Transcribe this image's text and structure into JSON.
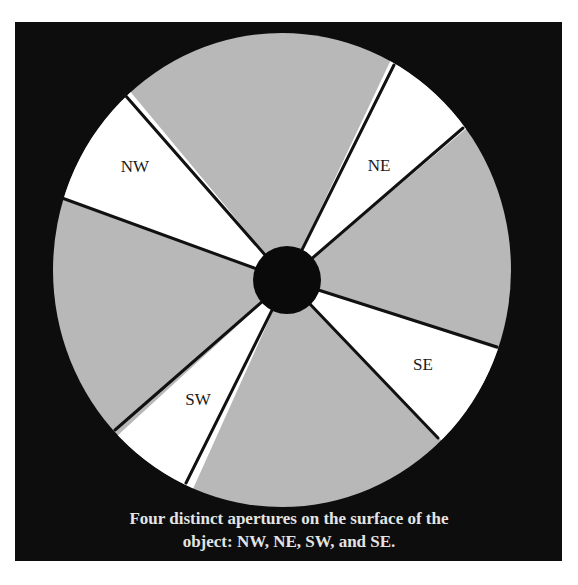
{
  "figure": {
    "caption_line1": "Four distinct apertures on the surface of the",
    "caption_line2": "object: NW, NE, SW, and SE.",
    "colors": {
      "background": "#0d0d0d",
      "disk": "#b8b8b8",
      "aperture": "#ffffff",
      "hub": "#0a0a0a",
      "divider": "#111111",
      "caption": "#e4e4e4"
    },
    "apertures": [
      {
        "id": "nw",
        "label": "NW"
      },
      {
        "id": "ne",
        "label": "NE"
      },
      {
        "id": "sw",
        "label": "SW"
      },
      {
        "id": "se",
        "label": "SE"
      }
    ]
  }
}
